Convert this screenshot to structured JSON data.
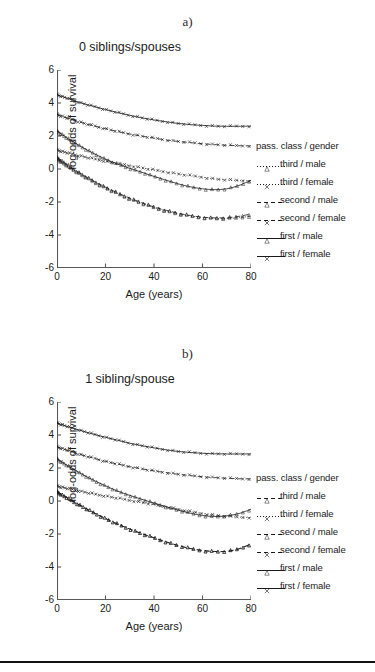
{
  "figure": {
    "bottom_rule": true,
    "axis_color": "#595959",
    "ink_color": "#1a1a1a"
  },
  "panels": [
    {
      "letter": "a)",
      "title": "0 siblings/spouses",
      "legend": {
        "title": "pass. class / gender",
        "items": [
          {
            "label": "third / male",
            "marker": "triangle",
            "dash": "dotted"
          },
          {
            "label": "third / female",
            "marker": "cross",
            "dash": "dotted"
          },
          {
            "label": "second / male",
            "marker": "triangle",
            "dash": "dashed"
          },
          {
            "label": "second / female",
            "marker": "cross",
            "dash": "dashed"
          },
          {
            "label": "first / male",
            "marker": "triangle",
            "dash": "solid"
          },
          {
            "label": "first / female",
            "marker": "cross",
            "dash": "solid"
          }
        ]
      },
      "chart_data": {
        "type": "line",
        "title": "0 siblings/spouses",
        "xlabel": "Age (years)",
        "ylabel": "log-odds of survival",
        "xlim": [
          0,
          80
        ],
        "ylim": [
          -6,
          6
        ],
        "xticks": [
          0,
          20,
          40,
          60,
          80
        ],
        "yticks": [
          -6,
          -4,
          -2,
          0,
          2,
          4,
          6
        ],
        "grid": false,
        "legend_position": "right",
        "x": [
          0,
          5,
          10,
          15,
          20,
          25,
          30,
          35,
          40,
          45,
          50,
          55,
          60,
          65,
          70,
          75,
          80
        ],
        "series": [
          {
            "name": "first / female",
            "marker": "cross",
            "dash": "solid",
            "values": [
              4.5,
              4.25,
              4.0,
              3.8,
              3.6,
              3.42,
              3.25,
              3.1,
              2.97,
              2.86,
              2.76,
              2.69,
              2.64,
              2.6,
              2.59,
              2.59,
              2.6
            ]
          },
          {
            "name": "second / female",
            "marker": "cross",
            "dash": "dashed",
            "values": [
              3.3,
              3.05,
              2.82,
              2.62,
              2.44,
              2.27,
              2.12,
              1.99,
              1.87,
              1.76,
              1.67,
              1.6,
              1.53,
              1.48,
              1.44,
              1.41,
              1.4
            ]
          },
          {
            "name": "first / male",
            "marker": "triangle",
            "dash": "solid",
            "values": [
              2.3,
              1.8,
              1.35,
              0.95,
              0.6,
              0.3,
              0.04,
              -0.2,
              -0.45,
              -0.68,
              -0.9,
              -1.08,
              -1.2,
              -1.25,
              -1.2,
              -1.0,
              -0.68
            ]
          },
          {
            "name": "third / female",
            "marker": "cross",
            "dash": "dotted",
            "values": [
              1.15,
              0.95,
              0.78,
              0.62,
              0.47,
              0.33,
              0.2,
              0.07,
              -0.06,
              -0.18,
              -0.3,
              -0.4,
              -0.5,
              -0.6,
              -0.66,
              -0.7,
              -0.72
            ]
          },
          {
            "name": "second / male",
            "marker": "triangle",
            "dash": "dashed",
            "values": [
              0.7,
              0.18,
              -0.3,
              -0.72,
              -1.1,
              -1.45,
              -1.76,
              -2.04,
              -2.3,
              -2.5,
              -2.68,
              -2.82,
              -2.92,
              -2.96,
              -2.95,
              -2.87,
              -2.72
            ]
          },
          {
            "name": "third / male",
            "marker": "triangle",
            "dash": "dotted",
            "values": [
              0.62,
              0.12,
              -0.34,
              -0.76,
              -1.14,
              -1.49,
              -1.8,
              -2.08,
              -2.33,
              -2.54,
              -2.72,
              -2.85,
              -2.94,
              -2.99,
              -3.0,
              -2.95,
              -2.85
            ]
          }
        ]
      }
    },
    {
      "letter": "b)",
      "title": "1 sibling/spouse",
      "legend": {
        "title": "pass. class / gender",
        "items": [
          {
            "label": "third / male",
            "marker": "triangle",
            "dash": "dashed"
          },
          {
            "label": "third / female",
            "marker": "cross",
            "dash": "dotted"
          },
          {
            "label": "second / male",
            "marker": "triangle",
            "dash": "dashed"
          },
          {
            "label": "second / female",
            "marker": "cross",
            "dash": "dashed"
          },
          {
            "label": "first / male",
            "marker": "triangle",
            "dash": "solid"
          },
          {
            "label": "first / female",
            "marker": "cross",
            "dash": "solid"
          }
        ]
      },
      "chart_data": {
        "type": "line",
        "title": "1 sibling/spouse",
        "xlabel": "Age (years)",
        "ylabel": "log-odds of survival",
        "xlim": [
          0,
          80
        ],
        "ylim": [
          -6,
          6
        ],
        "xticks": [
          0,
          20,
          40,
          60,
          80
        ],
        "yticks": [
          -6,
          -4,
          -2,
          0,
          2,
          4,
          6
        ],
        "grid": false,
        "legend_position": "right",
        "x": [
          0,
          5,
          10,
          15,
          20,
          25,
          30,
          35,
          40,
          45,
          50,
          55,
          60,
          65,
          70,
          75,
          80
        ],
        "series": [
          {
            "name": "first / female",
            "marker": "cross",
            "dash": "solid",
            "values": [
              4.72,
              4.48,
              4.26,
              4.05,
              3.86,
              3.68,
              3.5,
              3.35,
              3.22,
              3.1,
              3.0,
              2.94,
              2.89,
              2.86,
              2.85,
              2.85,
              2.85
            ]
          },
          {
            "name": "second / female",
            "marker": "cross",
            "dash": "dashed",
            "values": [
              3.28,
              3.04,
              2.8,
              2.6,
              2.4,
              2.24,
              2.08,
              1.95,
              1.82,
              1.72,
              1.62,
              1.54,
              1.47,
              1.42,
              1.38,
              1.35,
              1.34
            ]
          },
          {
            "name": "first / male",
            "marker": "triangle",
            "dash": "solid",
            "values": [
              2.55,
              2.08,
              1.65,
              1.26,
              0.92,
              0.6,
              0.34,
              0.1,
              -0.12,
              -0.35,
              -0.56,
              -0.74,
              -0.88,
              -0.94,
              -0.9,
              -0.76,
              -0.5
            ]
          },
          {
            "name": "third / female",
            "marker": "cross",
            "dash": "dotted",
            "values": [
              0.9,
              0.74,
              0.58,
              0.43,
              0.3,
              0.17,
              0.04,
              -0.09,
              -0.22,
              -0.35,
              -0.5,
              -0.64,
              -0.76,
              -0.86,
              -0.93,
              -0.98,
              -1.0
            ]
          },
          {
            "name": "third / male",
            "marker": "triangle",
            "dash": "dashed",
            "values": [
              0.56,
              0.12,
              -0.3,
              -0.7,
              -1.06,
              -1.4,
              -1.7,
              -1.98,
              -2.23,
              -2.48,
              -2.7,
              -2.88,
              -3.0,
              -3.06,
              -3.05,
              -2.9,
              -2.6
            ]
          },
          {
            "name": "second / male",
            "marker": "triangle",
            "dash": "dashed",
            "values": [
              0.56,
              0.12,
              -0.3,
              -0.7,
              -1.06,
              -1.4,
              -1.7,
              -1.98,
              -2.23,
              -2.48,
              -2.7,
              -2.88,
              -3.0,
              -3.06,
              -3.05,
              -2.9,
              -2.6
            ]
          }
        ]
      }
    }
  ]
}
